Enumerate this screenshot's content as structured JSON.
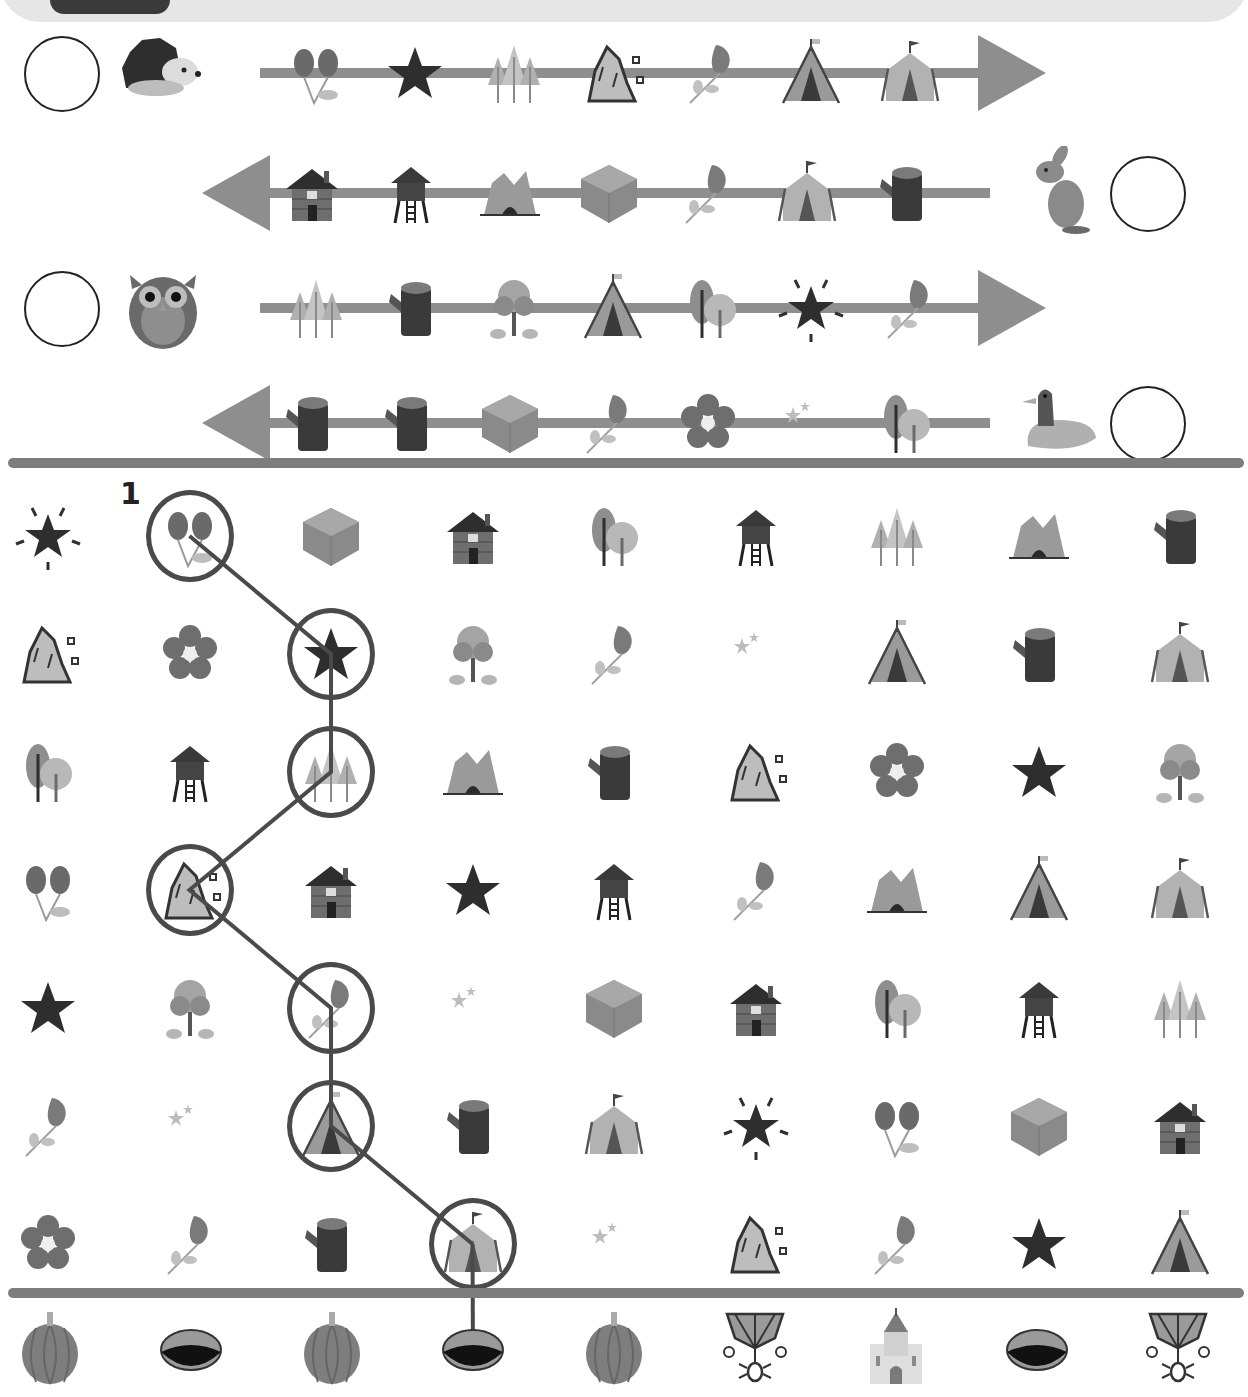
{
  "worksheet": {
    "title_tab": "",
    "sequences": [
      {
        "number": "1",
        "animal": "hedgehog",
        "direction": "right",
        "items": [
          "rosehip",
          "star",
          "pine-trees",
          "rock",
          "rose",
          "teepee",
          "tent"
        ]
      },
      {
        "number": "2",
        "animal": "rabbit",
        "direction": "left",
        "items": [
          "log-cabin",
          "stilt-house",
          "cave",
          "dirt-block",
          "rose",
          "tent",
          "stump"
        ]
      },
      {
        "number": "3",
        "animal": "owl",
        "direction": "right",
        "items": [
          "pine-trees",
          "stump",
          "bush-tree",
          "teepee",
          "round-trees",
          "sparkle-star",
          "rose"
        ]
      },
      {
        "number": "4",
        "animal": "duck",
        "direction": "left",
        "items": [
          "stump",
          "stump",
          "dirt-block",
          "rose",
          "flower",
          "moon",
          "round-trees"
        ]
      }
    ],
    "grid": {
      "start_label": "1",
      "rows": [
        [
          "sparkle-star",
          "rosehip",
          "dirt-block",
          "log-cabin",
          "round-trees",
          "stilt-house",
          "pine-trees",
          "cave",
          "stump"
        ],
        [
          "rock",
          "flower",
          "star",
          "bush-tree",
          "rose",
          "moon",
          "teepee",
          "stump",
          "tent"
        ],
        [
          "round-trees",
          "stilt-house",
          "pine-trees",
          "cave",
          "stump",
          "rock",
          "flower",
          "star",
          "bush-tree"
        ],
        [
          "rosehip",
          "rock",
          "log-cabin",
          "star",
          "stilt-house",
          "rose",
          "cave",
          "teepee",
          "tent"
        ],
        [
          "star",
          "bush-tree",
          "rose",
          "moon",
          "dirt-block",
          "log-cabin",
          "round-trees",
          "stilt-house",
          "pine-trees"
        ],
        [
          "rose",
          "moon",
          "teepee",
          "stump",
          "tent",
          "sparkle-star",
          "rosehip",
          "dirt-block",
          "log-cabin"
        ],
        [
          "flower",
          "rose",
          "stump",
          "tent",
          "moon",
          "rock",
          "rose",
          "star",
          "teepee"
        ]
      ],
      "traced_path": [
        [
          0,
          1
        ],
        [
          1,
          2
        ],
        [
          2,
          2
        ],
        [
          3,
          1
        ],
        [
          4,
          2
        ],
        [
          5,
          2
        ],
        [
          6,
          3
        ]
      ]
    },
    "goals": [
      "pumpkin",
      "hole",
      "pumpkin",
      "hole",
      "pumpkin",
      "spider-web",
      "castle",
      "hole",
      "spider-web"
    ],
    "traced_goal_index": 3
  },
  "colors": {
    "ink": "#2b2b2b",
    "arrow": "#8e8e8e",
    "divider": "#7d7d7d",
    "ring": "#4a4a4a",
    "bar": "#e6e6e6"
  }
}
